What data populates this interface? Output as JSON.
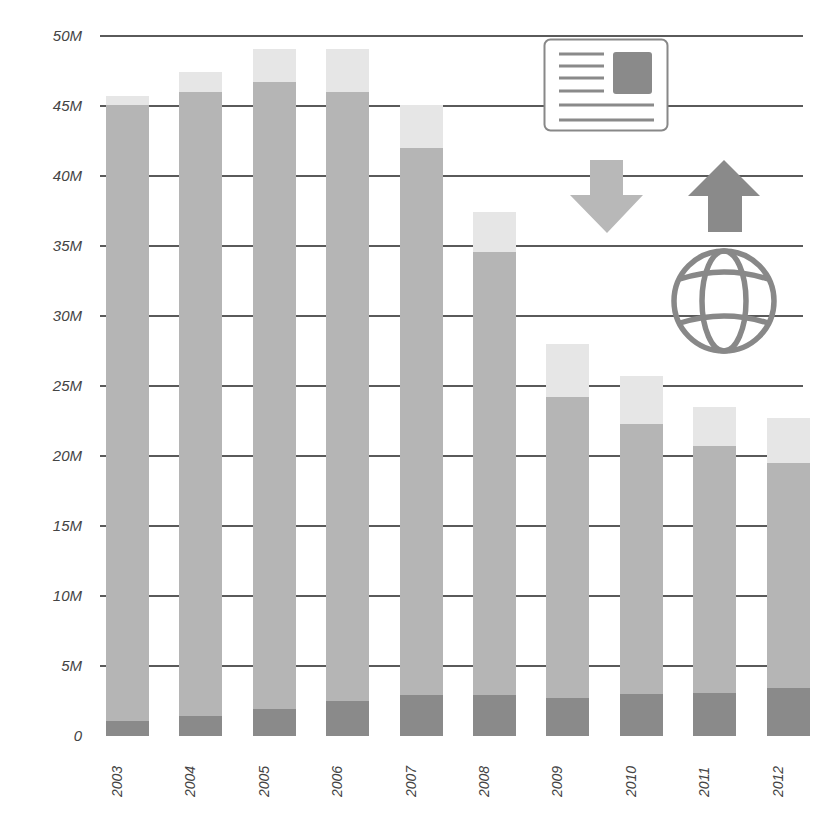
{
  "chart_data": {
    "type": "bar",
    "stacked": true,
    "title": "",
    "xlabel": "",
    "ylabel": "",
    "ylim": [
      0,
      50
    ],
    "yticks": [
      "0",
      "5M",
      "10M",
      "15M",
      "20M",
      "25M",
      "30M",
      "35M",
      "40M",
      "45M",
      "50M"
    ],
    "grid": true,
    "legend": "icon-based (newspaper, down arrow, up arrow, globe) in upper right",
    "categories": [
      "2003",
      "2004",
      "2005",
      "2006",
      "2007",
      "2008",
      "2009",
      "2010",
      "2011",
      "2012"
    ],
    "series": [
      {
        "name": "dark segment (bottom)",
        "color": "#8a8a8a",
        "values": [
          1.1,
          1.4,
          1.9,
          2.5,
          2.9,
          2.9,
          2.7,
          3.0,
          3.1,
          3.4
        ]
      },
      {
        "name": "mid segment",
        "color": "#b5b5b5",
        "values": [
          44.0,
          44.6,
          44.8,
          43.5,
          39.1,
          31.7,
          21.5,
          19.3,
          17.6,
          16.1
        ]
      },
      {
        "name": "light segment (top)",
        "color": "#e6e6e6",
        "values": [
          0.6,
          1.4,
          2.4,
          3.1,
          3.1,
          2.8,
          3.8,
          3.4,
          2.8,
          3.2
        ]
      }
    ],
    "totals": [
      45.7,
      47.4,
      49.1,
      49.1,
      45.1,
      37.4,
      28.0,
      25.7,
      23.5,
      22.7
    ],
    "units": "millions"
  },
  "legend_icons": [
    {
      "name": "newspaper-icon"
    },
    {
      "name": "arrow-down-icon",
      "color": "#b8b8b8"
    },
    {
      "name": "arrow-up-icon",
      "color": "#8a8a8a"
    },
    {
      "name": "globe-icon",
      "color": "#888888"
    }
  ]
}
